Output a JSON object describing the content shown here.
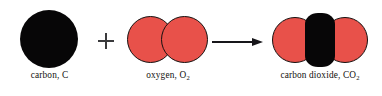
{
  "diagram": {
    "background_color": "#ffffff",
    "operators": {
      "plus": "+",
      "arrow": "→"
    },
    "colors": {
      "carbon_atom": "#070607",
      "oxygen_atom": "#e8514a",
      "atom_outline": "#16100f",
      "arrow": "#17161a",
      "plus": "#3a3a3c",
      "label_text": "#120f0e"
    },
    "species": [
      {
        "id": "carbon",
        "role": "reactant",
        "label_name": "carbon,",
        "label_formula": "C",
        "label_subscript": "",
        "atom_count": 1,
        "atoms": [
          {
            "element": "C",
            "color": "#070607"
          }
        ]
      },
      {
        "id": "oxygen",
        "role": "reactant",
        "label_name": "oxygen,",
        "label_formula": "O",
        "label_subscript": "2",
        "atom_count": 2,
        "atoms": [
          {
            "element": "O",
            "color": "#e8514a"
          },
          {
            "element": "O",
            "color": "#e8514a"
          }
        ]
      },
      {
        "id": "carbon-dioxide",
        "role": "product",
        "label_name": "carbon dioxide,",
        "label_formula": "CO",
        "label_subscript": "2",
        "atom_count": 3,
        "atoms": [
          {
            "element": "O",
            "color": "#e8514a"
          },
          {
            "element": "C",
            "color": "#070607"
          },
          {
            "element": "O",
            "color": "#e8514a"
          }
        ]
      }
    ]
  }
}
